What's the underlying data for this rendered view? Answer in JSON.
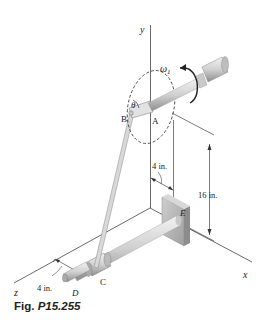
{
  "figure": {
    "caption_prefix": "Fig.",
    "caption_number": "P15.255"
  },
  "axes": {
    "x_label": "x",
    "y_label": "y",
    "z_label": "z"
  },
  "points": {
    "A": "A",
    "B": "B",
    "C": "C",
    "D": "D",
    "E": "E"
  },
  "symbols": {
    "omega": "ω",
    "omega_subscript": "1",
    "theta": "θ"
  },
  "dimensions": {
    "upper_offset": "4 in.",
    "height": "16 in.",
    "lower_offset": "4 in."
  },
  "colors": {
    "line": "#333333",
    "shaft_light": "#e4e4e4",
    "shaft_dark": "#9a9a9a",
    "plate": "#b8b8b8"
  }
}
